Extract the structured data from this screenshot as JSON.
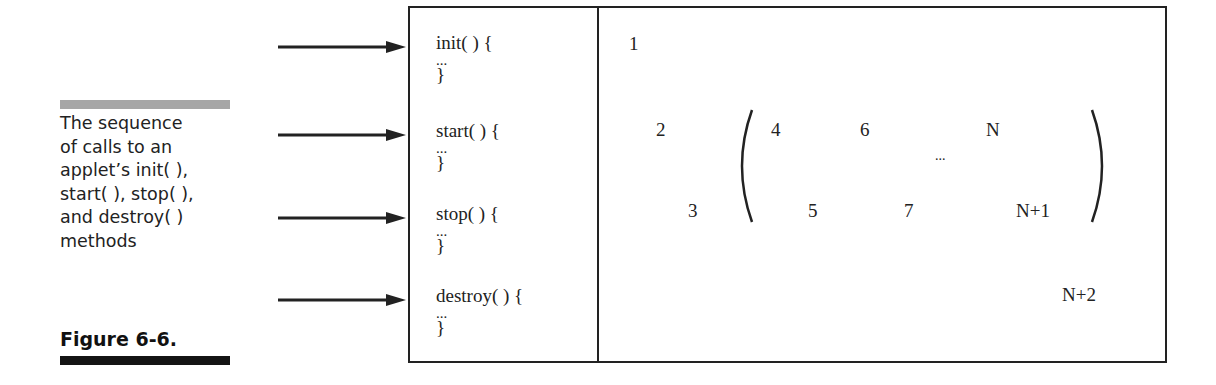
{
  "caption": {
    "lines": [
      "The sequence",
      "of calls to an",
      "applet’s init( ),",
      "start( ), stop( ),",
      "and destroy( )",
      "methods"
    ],
    "figure_label": "Figure 6-6."
  },
  "methods": [
    {
      "signature": "init( ) {",
      "body": "...",
      "close": "}"
    },
    {
      "signature": "start( ) {",
      "body": "...",
      "close": "}"
    },
    {
      "signature": "stop( ) {",
      "body": "...",
      "close": "}"
    },
    {
      "signature": "destroy( ) {",
      "body": "...",
      "close": "}"
    }
  ],
  "sequence": {
    "n1": "1",
    "n2": "2",
    "n3": "3",
    "n4": "4",
    "n5": "5",
    "n6": "6",
    "n7": "7",
    "ellipsis": "...",
    "nN": "N",
    "nN1": "N+1",
    "nN2": "N+2"
  },
  "colors": {
    "line": "#222222",
    "gray_bar": "#a6a6a6",
    "black_bar": "#141414"
  }
}
